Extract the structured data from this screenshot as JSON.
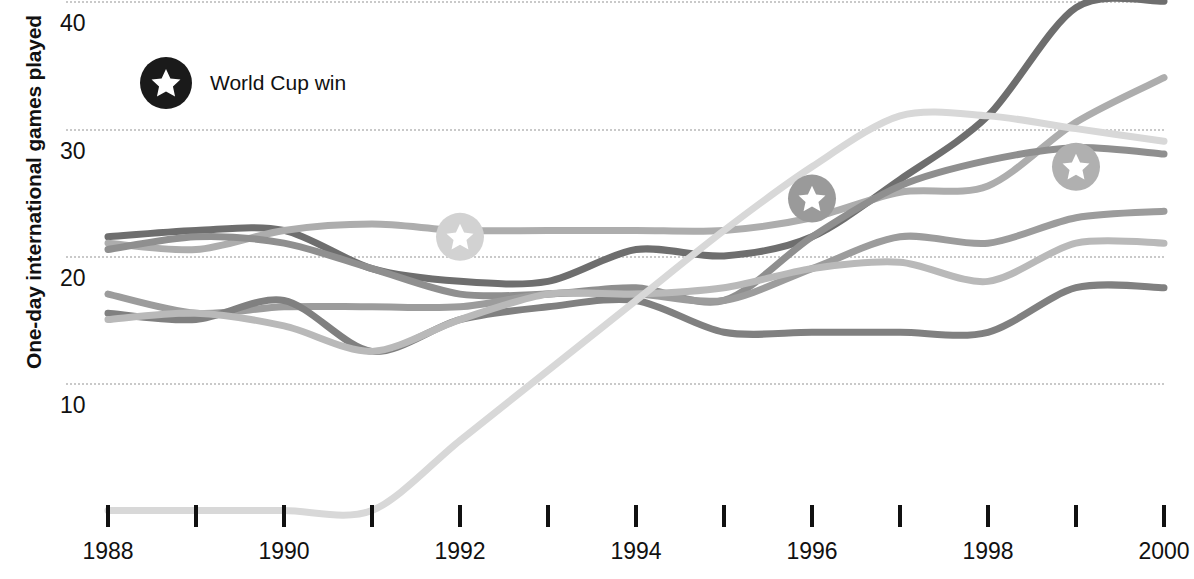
{
  "chart_data": {
    "type": "line",
    "title": "",
    "xlabel": "",
    "ylabel": "One-day international games played",
    "xlim": [
      1988,
      2000
    ],
    "ylim": [
      0,
      42
    ],
    "grid": true,
    "gridlines": [
      10,
      20,
      30,
      40
    ],
    "x": [
      1988,
      1989,
      1990,
      1991,
      1992,
      1993,
      1994,
      1995,
      1996,
      1997,
      1998,
      1999,
      2000
    ],
    "y_ticks": [
      "10",
      "20",
      "30",
      "40"
    ],
    "x_ticks": [
      1988,
      1989,
      1990,
      1991,
      1992,
      1993,
      1994,
      1995,
      1996,
      1997,
      1998,
      1999,
      2000
    ],
    "x_tick_labels": [
      "1988",
      "",
      "1990",
      "",
      "1992",
      "",
      "1994",
      "",
      "1996",
      "",
      "1998",
      "",
      "2000"
    ],
    "series": [
      {
        "name": "series-1",
        "color": "#6e6e6e",
        "values": [
          21.5,
          22.0,
          22.0,
          19.0,
          18.0,
          18.0,
          20.5,
          20.0,
          21.5,
          26.0,
          31.0,
          39.5,
          40.0
        ]
      },
      {
        "name": "series-2",
        "color": "#adadad",
        "values": [
          21.0,
          20.5,
          22.0,
          22.5,
          22.0,
          22.0,
          22.0,
          22.0,
          23.0,
          25.0,
          25.5,
          30.5,
          34.0
        ]
      },
      {
        "name": "series-3",
        "color": "#8f8f8f",
        "values": [
          20.5,
          21.5,
          21.0,
          19.0,
          17.0,
          17.0,
          17.5,
          16.5,
          21.5,
          25.5,
          27.5,
          28.5,
          28.0
        ]
      },
      {
        "name": "series-4",
        "color": "#9c9c9c",
        "values": [
          17.0,
          15.5,
          16.0,
          16.0,
          16.0,
          17.0,
          17.0,
          16.5,
          19.0,
          21.5,
          21.0,
          23.0,
          23.5
        ]
      },
      {
        "name": "series-5",
        "color": "#808080",
        "values": [
          15.5,
          15.0,
          16.5,
          12.5,
          15.0,
          16.0,
          16.5,
          14.0,
          14.0,
          14.0,
          14.0,
          17.5,
          17.5
        ]
      },
      {
        "name": "series-6",
        "color": "#b9b9b9",
        "values": [
          15.0,
          15.5,
          14.5,
          12.5,
          15.0,
          17.0,
          17.0,
          17.5,
          19.0,
          19.5,
          18.0,
          21.0,
          21.0
        ]
      },
      {
        "name": "series-7",
        "color": "#d8d8d8",
        "values": [
          0.0,
          0.0,
          0.0,
          0.0,
          5.5,
          11.0,
          16.5,
          22.0,
          27.0,
          31.0,
          31.0,
          30.0,
          29.0
        ]
      }
    ],
    "markers": [
      {
        "name": "world-cup-win-1992",
        "x": 1992.0,
        "y": 21.5,
        "color": "#d2d2d2",
        "label": "World Cup win"
      },
      {
        "name": "world-cup-win-1996",
        "x": 1996.0,
        "y": 24.5,
        "color": "#9a9a9a",
        "label": "World Cup win"
      },
      {
        "name": "world-cup-win-1999",
        "x": 1999.0,
        "y": 27.0,
        "color": "#b0b0b0",
        "label": "World Cup win"
      }
    ],
    "legend": {
      "position": "top-left",
      "entries": [
        {
          "label": "World Cup win",
          "icon": "star-badge-icon",
          "color": "#1a1a1a"
        }
      ]
    }
  }
}
